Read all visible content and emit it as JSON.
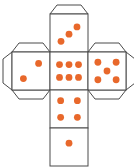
{
  "figure": {
    "name": "cube-net-dice",
    "width": 134,
    "height": 167,
    "background_color": "#ffffff"
  },
  "style": {
    "pip_color": "#E8682B",
    "face_fill": "#ffffff",
    "face_stroke": "#4a4a4a",
    "tab_fill": "#ffffff",
    "tab_stroke": "#4a4a4a",
    "stroke_width": 1,
    "pip_radius": 3.4
  },
  "geometry": {
    "face_size": 38,
    "col_x": [
      12,
      50,
      88
    ],
    "row_y": [
      14,
      52,
      90,
      128
    ],
    "tab_depth": 9,
    "tab_inset": 7
  },
  "faces": [
    {
      "id": "face-top",
      "name": "top-face",
      "label": "3",
      "pip_count": 3,
      "col": 1,
      "row": 0,
      "x": 50,
      "y": 14,
      "pips": [
        {
          "cx": 0.29,
          "cy": 0.72
        },
        {
          "cx": 0.5,
          "cy": 0.53
        },
        {
          "cx": 0.71,
          "cy": 0.34
        }
      ]
    },
    {
      "id": "face-left",
      "name": "left-face",
      "label": "2",
      "pip_count": 2,
      "col": 0,
      "row": 1,
      "x": 12,
      "y": 52,
      "pips": [
        {
          "cx": 0.3,
          "cy": 0.7
        },
        {
          "cx": 0.7,
          "cy": 0.3
        }
      ]
    },
    {
      "id": "face-center",
      "name": "center-face",
      "label": "6",
      "pip_count": 6,
      "col": 1,
      "row": 1,
      "x": 50,
      "y": 52,
      "pips": [
        {
          "cx": 0.25,
          "cy": 0.33
        },
        {
          "cx": 0.5,
          "cy": 0.33
        },
        {
          "cx": 0.75,
          "cy": 0.33
        },
        {
          "cx": 0.25,
          "cy": 0.67
        },
        {
          "cx": 0.5,
          "cy": 0.67
        },
        {
          "cx": 0.75,
          "cy": 0.67
        }
      ]
    },
    {
      "id": "face-right",
      "name": "right-face",
      "label": "5",
      "pip_count": 5,
      "col": 2,
      "row": 1,
      "x": 88,
      "y": 52,
      "pips": [
        {
          "cx": 0.26,
          "cy": 0.27
        },
        {
          "cx": 0.74,
          "cy": 0.27
        },
        {
          "cx": 0.5,
          "cy": 0.5
        },
        {
          "cx": 0.26,
          "cy": 0.73
        },
        {
          "cx": 0.74,
          "cy": 0.73
        }
      ]
    },
    {
      "id": "face-bottom-upper",
      "name": "bottom-upper-face",
      "label": "4",
      "pip_count": 4,
      "col": 1,
      "row": 2,
      "x": 50,
      "y": 90,
      "pips": [
        {
          "cx": 0.28,
          "cy": 0.28
        },
        {
          "cx": 0.72,
          "cy": 0.28
        },
        {
          "cx": 0.28,
          "cy": 0.72
        },
        {
          "cx": 0.72,
          "cy": 0.72
        }
      ]
    },
    {
      "id": "face-bottom-lower",
      "name": "bottom-lower-face",
      "label": "1",
      "pip_count": 1,
      "col": 1,
      "row": 3,
      "x": 50,
      "y": 128,
      "pips": [
        {
          "cx": 0.5,
          "cy": 0.4
        }
      ]
    }
  ],
  "tabs": [
    {
      "id": "tab-top-center",
      "name": "glue-tab-top-center",
      "edge": "top",
      "face": "face-top"
    },
    {
      "id": "tab-top-left",
      "name": "glue-tab-top-left",
      "edge": "top",
      "face": "face-left"
    },
    {
      "id": "tab-top-right",
      "name": "glue-tab-top-right",
      "edge": "top",
      "face": "face-right"
    },
    {
      "id": "tab-left-outer",
      "name": "glue-tab-left-outer",
      "edge": "left",
      "face": "face-left"
    },
    {
      "id": "tab-right-outer",
      "name": "glue-tab-right-outer",
      "edge": "right",
      "face": "face-right"
    },
    {
      "id": "tab-bottom-left",
      "name": "glue-tab-bottom-left",
      "edge": "bottom",
      "face": "face-left"
    },
    {
      "id": "tab-bottom-right",
      "name": "glue-tab-bottom-right",
      "edge": "bottom",
      "face": "face-right"
    }
  ]
}
